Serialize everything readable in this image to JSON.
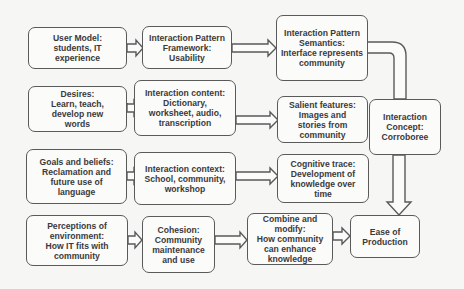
{
  "diagram": {
    "boxes": {
      "user_model": "User Model:\nstudents, IT\nexperience",
      "pattern_framework": "Interaction Pattern\nFramework:\nUsability",
      "pattern_semantics": "Interaction Pattern\nSemantics:\nInterface represents\ncommunity",
      "desires": "Desires:\nLearn, teach,\ndevelop new\nwords",
      "interaction_content": "Interaction content:\nDictionary,\nworksheet, audio,\ntranscription",
      "salient_features": "Salient features:\nImages and\nstories from\ncommunity",
      "interaction_concept": "Interaction\nConcept:\nCorroboree",
      "goals_beliefs": "Goals and beliefs:\nReclamation and\nfuture use of\nlanguage",
      "interaction_context": "Interaction context:\nSchool, community,\nworkshop",
      "cognitive_trace": "Cognitive trace:\nDevelopment of\nknowledge over\ntime",
      "perceptions": "Perceptions of\nenvironment:\nHow IT fits with\ncommunity",
      "cohesion": "Cohesion:\nCommunity\nmaintenance\nand use",
      "combine_modify": "Combine and\nmodify:\nHow community\ncan enhance\nknowledge",
      "ease_production": "Ease of\nProduction"
    },
    "connections": [
      {
        "from": "User Model",
        "to": "Interaction Pattern Framework"
      },
      {
        "from": "Interaction Pattern Framework",
        "to": "Interaction Pattern Semantics"
      },
      {
        "from": "Interaction Pattern Semantics",
        "to": "Interaction Concept"
      },
      {
        "from": "Desires",
        "to": "Interaction content"
      },
      {
        "from": "Interaction content",
        "to": "Salient features"
      },
      {
        "from": "Goals and beliefs",
        "to": "Interaction context"
      },
      {
        "from": "Interaction context",
        "to": "Cognitive trace"
      },
      {
        "from": "Perceptions of environment",
        "to": "Cohesion"
      },
      {
        "from": "Cohesion",
        "to": "Combine and modify"
      },
      {
        "from": "Combine and modify",
        "to": "Ease of Production"
      },
      {
        "from": "Interaction Concept",
        "to": "Ease of Production"
      }
    ],
    "colors": {
      "border": "#5a5a5a",
      "text": "#3a3a3a",
      "background": "#f6f6f4"
    }
  }
}
